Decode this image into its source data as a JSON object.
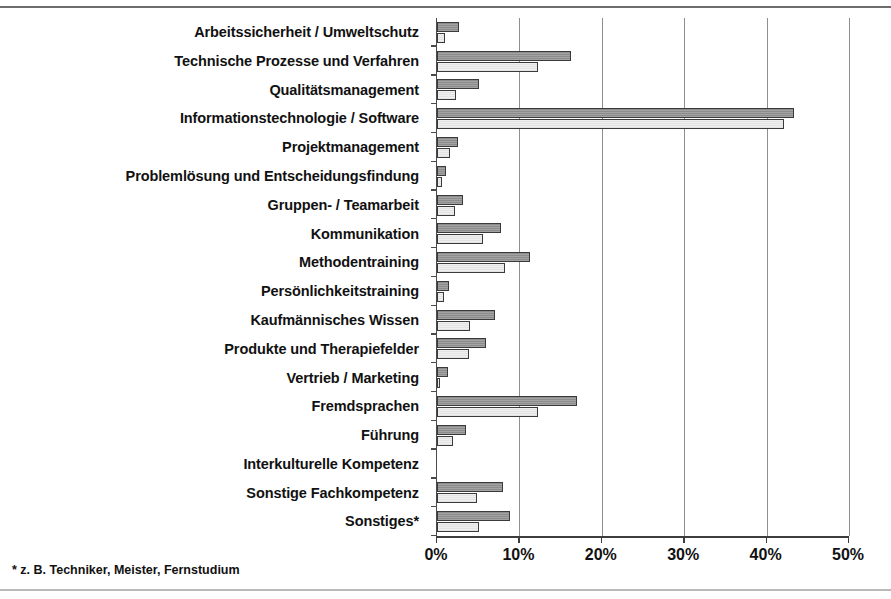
{
  "chart_data": {
    "type": "bar",
    "orientation": "horizontal",
    "title": "",
    "xlabel": "",
    "ylabel": "",
    "xlim": [
      0,
      50
    ],
    "xticks": [
      0,
      10,
      20,
      30,
      40,
      50
    ],
    "xtick_labels": [
      "0%",
      "10%",
      "20%",
      "30%",
      "40%",
      "50%"
    ],
    "grid": true,
    "legend": "none",
    "categories": [
      "Arbeitssicherheit / Umweltschutz",
      "Technische Prozesse und Verfahren",
      "Qualitätsmanagement",
      "Informationstechnologie / Software",
      "Projektmanagement",
      "Problemlösung und Entscheidungsfindung",
      "Gruppen- / Teamarbeit",
      "Kommunikation",
      "Methodentraining",
      "Persönlichkeitstraining",
      "Kaufmännisches Wissen",
      "Produkte und Therapiefelder",
      "Vertrieb / Marketing",
      "Fremdsprachen",
      "Führung",
      "Interkulturelle Kompetenz",
      "Sonstige Fachkompetenz",
      "Sonstiges*"
    ],
    "series": [
      {
        "name": "series-a",
        "color": "#8c8c8c",
        "values": [
          2.7,
          16.3,
          5.1,
          43.3,
          2.6,
          1.1,
          3.2,
          7.8,
          11.3,
          1.5,
          7.0,
          5.9,
          1.3,
          17.0,
          3.5,
          0.0,
          8.0,
          8.9
        ]
      },
      {
        "name": "series-b",
        "color": "#efefef",
        "values": [
          1.0,
          12.3,
          2.3,
          42.1,
          1.6,
          0.6,
          2.2,
          5.6,
          8.3,
          0.8,
          4.0,
          3.9,
          0.4,
          12.2,
          2.0,
          0.0,
          4.9,
          5.1
        ]
      }
    ]
  },
  "footnote": "* z. B. Techniker, Meister, Fernstudium"
}
